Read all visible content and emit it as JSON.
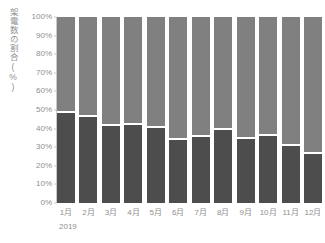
{
  "chart_data": {
    "type": "bar",
    "subtype": "stacked-100-percent",
    "title": "",
    "xlabel": "",
    "ylabel": "架電数の割合(%)",
    "period_label": "2019",
    "categories": [
      "1月",
      "2月",
      "3月",
      "4月",
      "5月",
      "6月",
      "7月",
      "8月",
      "9月",
      "10月",
      "11月",
      "12月"
    ],
    "ylim": [
      0,
      100
    ],
    "ytick_labels": [
      "0%",
      "10%",
      "20%",
      "30%",
      "40%",
      "50%",
      "60%",
      "70%",
      "80%",
      "90%",
      "100%"
    ],
    "ytick_values": [
      0,
      10,
      20,
      30,
      40,
      50,
      60,
      70,
      80,
      90,
      100
    ],
    "grid": false,
    "legend": "none",
    "series": [
      {
        "name": "lower-segment",
        "color": "#4d4d4d",
        "values": [
          49,
          47,
          42,
          42.5,
          41,
          34,
          36,
          39.5,
          35,
          36.5,
          31,
          26.5
        ]
      },
      {
        "name": "upper-segment",
        "color": "#808080",
        "values": [
          51,
          53,
          58,
          57.5,
          59,
          66,
          64,
          60.5,
          65,
          63.5,
          69,
          73.5
        ]
      }
    ]
  },
  "colors": {
    "lower_segment": "#4d4d4d",
    "upper_segment": "#808080",
    "axis": "#c9c9c9",
    "text": "#8f8f8f",
    "background": "#ffffff"
  }
}
